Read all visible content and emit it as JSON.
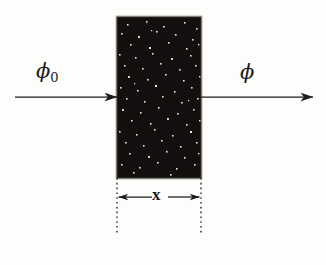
{
  "figure": {
    "background_color": "#fdfdfb",
    "ink_color": "#1b1b1b"
  },
  "labels": {
    "incident_flux": "ϕ",
    "incident_flux_subscript": "0",
    "emergent_flux": "ϕ",
    "thickness": "x"
  },
  "slab": {
    "name": "absorber-slab",
    "fill_color": "#120f0e",
    "edge_color": "#9b9893",
    "speckle_color": "#e8e6e0",
    "x": 117,
    "y": 17,
    "width": 84,
    "height": 161
  },
  "arrows": {
    "incident": {
      "label": "incident-beam-arrow",
      "x1": 15,
      "x2": 117,
      "y": 97
    },
    "emergent": {
      "label": "emergent-beam-arrow",
      "x1": 201,
      "x2": 313,
      "y": 97
    }
  },
  "dimension": {
    "label": "thickness-dimension",
    "left_x": 117,
    "right_x": 201,
    "y": 197,
    "extension_top": 178,
    "extension_bottom": 232
  },
  "colors": {
    "ink": "#1b1b1b",
    "slab_fill": "#120f0e",
    "slab_edge": "#9b9893",
    "speckle": "#e8e6e0",
    "background": "#fdfdfb"
  }
}
